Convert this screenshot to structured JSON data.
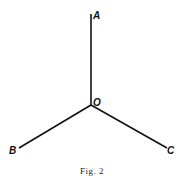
{
  "figure": {
    "caption": "Fig. 2",
    "center": {
      "label": "O",
      "x": 91,
      "y": 105
    },
    "rays": [
      {
        "label": "A",
        "x": 91,
        "y": 14
      },
      {
        "label": "B",
        "x": 19,
        "y": 148
      },
      {
        "label": "C",
        "x": 167,
        "y": 148
      }
    ],
    "line_color": "#111111"
  }
}
